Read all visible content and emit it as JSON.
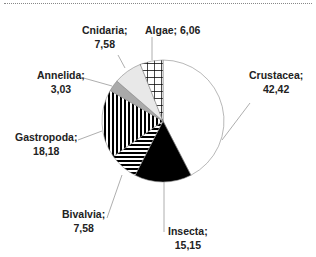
{
  "chart_data": {
    "type": "pie",
    "title": "",
    "start_angle_deg": 0,
    "direction": "clockwise",
    "slices": [
      {
        "label": "Crustacea",
        "value": 42.42,
        "pattern": "white"
      },
      {
        "label": "Insecta",
        "value": 15.15,
        "pattern": "black"
      },
      {
        "label": "Bivalvia",
        "value": 7.58,
        "pattern": "horizontal-stripes"
      },
      {
        "label": "Gastropoda",
        "value": 18.18,
        "pattern": "vertical-stripes"
      },
      {
        "label": "Annelida",
        "value": 3.03,
        "pattern": "gray"
      },
      {
        "label": "Cnidaria",
        "value": 7.58,
        "pattern": "light-gray"
      },
      {
        "label": "Algae",
        "value": 6.06,
        "pattern": "grid"
      }
    ]
  },
  "labels": {
    "crustacea": {
      "name": "Crustacea;",
      "value": "42,42"
    },
    "insecta": {
      "name": "Insecta;",
      "value": "15,15"
    },
    "bivalvia": {
      "name": "Bivalvia;",
      "value": "7,58"
    },
    "gastropoda": {
      "name": "Gastropoda;",
      "value": "18,18"
    },
    "annelida": {
      "name": "Annelida;",
      "value": "3,03"
    },
    "cnidaria": {
      "name": "Cnidaria;",
      "value": "7,58"
    },
    "algae": {
      "name": "Algae; 6,06"
    }
  }
}
